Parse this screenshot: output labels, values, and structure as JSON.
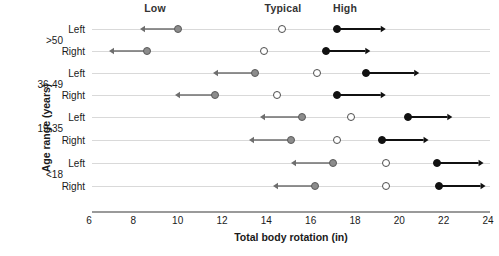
{
  "chart_data": {
    "type": "scatter",
    "title": "",
    "xlabel": "Total body rotation (in)",
    "ylabel": "Age range (years)",
    "xlim": [
      6,
      24
    ],
    "xticks": [
      6,
      8,
      10,
      12,
      14,
      16,
      18,
      20,
      22,
      24
    ],
    "xtick_labels": [
      "6",
      "8",
      "10",
      "12",
      "14",
      "16",
      "18",
      "20",
      "22",
      "24"
    ],
    "grid": false,
    "legend_position": "top",
    "column_headers": [
      "Low",
      "Typical",
      "High"
    ],
    "series": [
      {
        "name": "Low",
        "marker": "filled-gray-circle",
        "color": "#8c8c8c",
        "arrow_direction": "left"
      },
      {
        "name": "Typical",
        "marker": "open-circle",
        "color": "#ffffff",
        "arrow_direction": "none"
      },
      {
        "name": "High",
        "marker": "filled-black-circle",
        "color": "#111111",
        "arrow_direction": "right"
      }
    ],
    "age_groups": [
      ">50",
      "36-49",
      "19-35",
      "<18"
    ],
    "sides": [
      "Left",
      "Right"
    ],
    "rows": [
      {
        "age_group": ">50",
        "side": "Left",
        "low": 10.0,
        "typical": 14.7,
        "high": 17.2,
        "low_arrow_end": 8.3,
        "high_arrow_end": 19.4
      },
      {
        "age_group": ">50",
        "side": "Right",
        "low": 8.6,
        "typical": 13.9,
        "high": 16.7,
        "low_arrow_end": 6.9,
        "high_arrow_end": 18.7
      },
      {
        "age_group": "36-49",
        "side": "Left",
        "low": 13.5,
        "typical": 16.3,
        "high": 18.5,
        "low_arrow_end": 11.6,
        "high_arrow_end": 20.9
      },
      {
        "age_group": "36-49",
        "side": "Right",
        "low": 11.7,
        "typical": 14.5,
        "high": 17.2,
        "low_arrow_end": 9.9,
        "high_arrow_end": 19.4
      },
      {
        "age_group": "19-35",
        "side": "Left",
        "low": 15.6,
        "typical": 17.8,
        "high": 20.4,
        "low_arrow_end": 13.7,
        "high_arrow_end": 22.4
      },
      {
        "age_group": "19-35",
        "side": "Right",
        "low": 15.1,
        "typical": 17.2,
        "high": 19.2,
        "low_arrow_end": 13.2,
        "high_arrow_end": 21.3
      },
      {
        "age_group": "<18",
        "side": "Left",
        "low": 17.0,
        "typical": 19.4,
        "high": 21.7,
        "low_arrow_end": 15.1,
        "high_arrow_end": 23.8
      },
      {
        "age_group": "<18",
        "side": "Right",
        "low": 16.2,
        "typical": 19.4,
        "high": 21.8,
        "low_arrow_end": 14.3,
        "high_arrow_end": 23.9
      }
    ]
  },
  "axis": {
    "x_title": "Total body rotation (in)",
    "y_title": "Age range (years)"
  },
  "headers": {
    "low": "Low",
    "typical": "Typical",
    "high": "High"
  },
  "age_labels": {
    "g0": ">50",
    "g1": "36-49",
    "g2": "19-35",
    "g3": "<18"
  },
  "row_labels": {
    "r0": "Left",
    "r1": "Right",
    "r2": "Left",
    "r3": "Right",
    "r4": "Left",
    "r5": "Right",
    "r6": "Left",
    "r7": "Right"
  },
  "xticks": {
    "t0": "6",
    "t1": "8",
    "t2": "10",
    "t3": "12",
    "t4": "14",
    "t5": "16",
    "t6": "18",
    "t7": "20",
    "t8": "22",
    "t9": "24"
  },
  "colors": {
    "low_marker": "#8c8c8c",
    "typical_marker": "#ffffff",
    "high_marker": "#111111",
    "row_line": "#d9d9d9",
    "axis": "#9a9a9a",
    "text": "#1a1a1a"
  }
}
